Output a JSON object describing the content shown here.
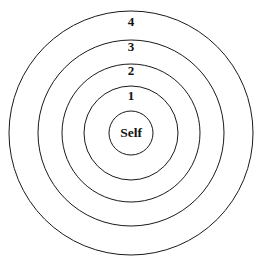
{
  "diagram": {
    "type": "concentric-circles",
    "background_color": "#ffffff",
    "stroke_color": "#1a1a1a",
    "text_color": "#111111",
    "stroke_width": 1,
    "center": {
      "x": 131,
      "y": 133
    },
    "rings": [
      {
        "id": "ring-self",
        "label": "Self",
        "level": 0,
        "radius": 22,
        "label_x": 131,
        "label_y": 134,
        "label_kind": "core"
      },
      {
        "id": "ring-1",
        "label": "1",
        "level": 1,
        "radius": 47,
        "label_x": 131,
        "label_y": 97,
        "label_kind": "numeric"
      },
      {
        "id": "ring-2",
        "label": "2",
        "level": 2,
        "radius": 69,
        "label_x": 131,
        "label_y": 72,
        "label_kind": "numeric"
      },
      {
        "id": "ring-3",
        "label": "3",
        "level": 3,
        "radius": 93,
        "label_x": 131,
        "label_y": 48,
        "label_kind": "numeric"
      },
      {
        "id": "ring-4",
        "label": "4",
        "level": 4,
        "radius": 122,
        "label_x": 131,
        "label_y": 23,
        "label_kind": "numeric"
      }
    ]
  }
}
